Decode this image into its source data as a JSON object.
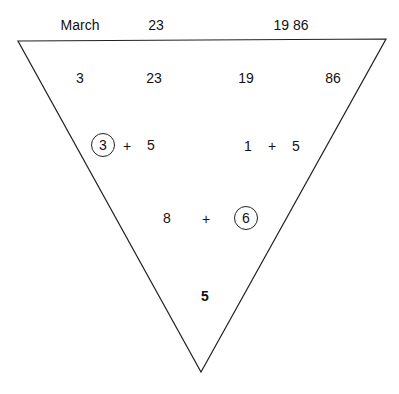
{
  "header": {
    "month": "March",
    "day": "23",
    "year": "19 86"
  },
  "row1": [
    "3",
    "23",
    "19",
    "86"
  ],
  "row2": {
    "left": {
      "a": "3",
      "op": "+",
      "b": "5",
      "circled": "a"
    },
    "right": {
      "a": "1",
      "op": "+",
      "b": "5"
    }
  },
  "row3": {
    "a": "8",
    "op": "+",
    "b": "6",
    "circled": "b"
  },
  "result": "5",
  "colors": {
    "line": "#222222",
    "text": "#111111",
    "background": "#ffffff"
  }
}
